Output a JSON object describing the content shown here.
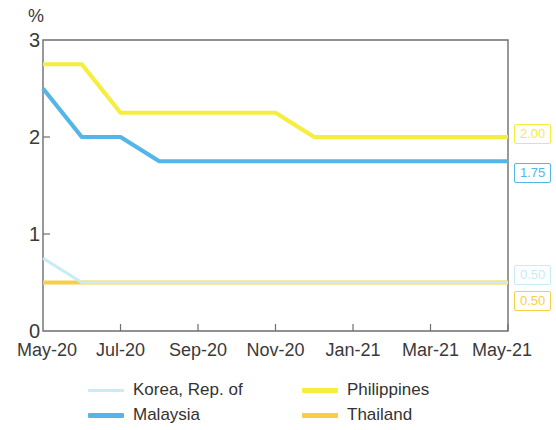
{
  "chart_data": {
    "type": "line",
    "title": "",
    "subtitle": "",
    "xlabel": "",
    "ylabel": "%",
    "ylim": [
      0,
      3
    ],
    "yticks": [
      0,
      1,
      2,
      3
    ],
    "ytick_labels": [
      "0",
      "1",
      "2",
      "3"
    ],
    "grid": false,
    "legend_position": "bottom",
    "x": [
      "May-20",
      "Jun-20",
      "Jul-20",
      "Aug-20",
      "Sep-20",
      "Oct-20",
      "Nov-20",
      "Dec-20",
      "Jan-21",
      "Feb-21",
      "Mar-21",
      "Apr-21",
      "May-21"
    ],
    "xtick_labels": [
      "May-20",
      "Jul-20",
      "Sep-20",
      "Nov-20",
      "Jan-21",
      "Mar-21",
      "May-21"
    ],
    "xtick_positions": [
      0,
      2,
      4,
      6,
      8,
      10,
      12
    ],
    "series": [
      {
        "name": "Korea, Rep. of",
        "color": "#c7ecf8",
        "values": [
          0.75,
          0.5,
          0.5,
          0.5,
          0.5,
          0.5,
          0.5,
          0.5,
          0.5,
          0.5,
          0.5,
          0.5,
          0.5
        ],
        "end_label": "0.50",
        "end_label_color": "#c7ecf8"
      },
      {
        "name": "Malaysia",
        "color": "#54b6e8",
        "values": [
          2.5,
          2.0,
          2.0,
          1.75,
          1.75,
          1.75,
          1.75,
          1.75,
          1.75,
          1.75,
          1.75,
          1.75,
          1.75
        ],
        "end_label": "1.75",
        "end_label_color": "#54b6e8"
      },
      {
        "name": "Philippines",
        "color": "#f6ee3c",
        "values": [
          2.75,
          2.75,
          2.25,
          2.25,
          2.25,
          2.25,
          2.25,
          2.0,
          2.0,
          2.0,
          2.0,
          2.0,
          2.0
        ],
        "end_label": "2.00",
        "end_label_color": "#f6ee3c"
      },
      {
        "name": "Thailand",
        "color": "#f7cf45",
        "values": [
          0.5,
          0.5,
          0.5,
          0.5,
          0.5,
          0.5,
          0.5,
          0.5,
          0.5,
          0.5,
          0.5,
          0.5,
          0.5
        ],
        "end_label": "0.50",
        "end_label_color": "#f7cf45"
      }
    ]
  },
  "axis": {
    "unit_label": "%"
  },
  "legend": {
    "items": [
      {
        "label": "Korea, Rep. of",
        "color": "#c7ecf8"
      },
      {
        "label": "Malaysia",
        "color": "#54b6e8"
      },
      {
        "label": "Philippines",
        "color": "#f6ee3c"
      },
      {
        "label": "Thailand",
        "color": "#f7cf45"
      }
    ]
  }
}
